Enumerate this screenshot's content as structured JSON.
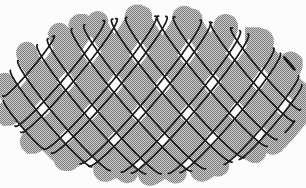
{
  "figure": {
    "type": "woven-ellipsoid",
    "canvas": {
      "width": 306,
      "height": 188,
      "background": "#fcfcfc"
    },
    "ellipsoid": {
      "a": 150,
      "b": 80,
      "c": 58,
      "cx": 153,
      "cy": 95,
      "tilt_deg": 14
    },
    "weave": {
      "slope_deg": 50,
      "spacing": 37,
      "samples": 288,
      "band_visibility_threshold": 0.015,
      "line_visibility_threshold": -0.06,
      "families": [
        {
          "name": "descending-strands",
          "dir": 1,
          "phase": 5,
          "band_width": 21,
          "count": 9
        },
        {
          "name": "ascending-strands",
          "dir": -1,
          "phase": -11,
          "band_width": 24,
          "count": 9
        }
      ]
    },
    "style": {
      "halftone_light": "#c9c9c9",
      "halftone_dark": "#7d7d7d",
      "outline_color": "#1a1a1a",
      "outline_width": 1.7,
      "hole_color": "#fcfcfc"
    }
  }
}
